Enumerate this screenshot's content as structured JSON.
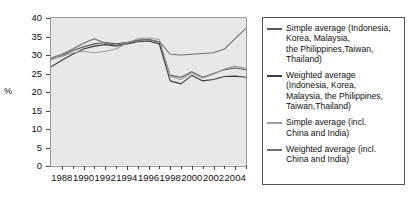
{
  "chart_data": {
    "type": "line",
    "title": "",
    "xlabel": "",
    "ylabel": "%",
    "ylim": [
      0,
      40
    ],
    "xlim": [
      1987,
      2005
    ],
    "ytick_labels": [
      "40",
      "35",
      "30",
      "25",
      "20",
      "15",
      "10",
      "5",
      "0"
    ],
    "ytick_values": [
      40,
      35,
      30,
      25,
      20,
      15,
      10,
      5,
      0
    ],
    "xtick_labels": [
      "1988",
      "1990",
      "1992",
      "1994",
      "1996",
      "1998",
      "2000",
      "2002",
      "2004"
    ],
    "xtick_values": [
      1988,
      1990,
      1992,
      1994,
      1996,
      1998,
      2000,
      2002,
      2004
    ],
    "grid": false,
    "legend_position": "right-outside",
    "plot_background": "#e8e8e8",
    "x": [
      1987,
      1988,
      1989,
      1990,
      1991,
      1992,
      1993,
      1994,
      1995,
      1996,
      1997,
      1998,
      1999,
      2000,
      2001,
      2002,
      2003,
      2004,
      2005
    ],
    "series": [
      {
        "name": "Simple average (Indonesia, Korea, Malaysia, the Philippines, Taiwan, Thailand)",
        "color": "#5a5a5a",
        "values": [
          28.8,
          29.8,
          31.2,
          32.2,
          33.0,
          33.4,
          33.0,
          33.4,
          34.0,
          34.2,
          33.5,
          24.5,
          24.0,
          25.5,
          24.0,
          25.0,
          26.0,
          26.5,
          26.0
        ]
      },
      {
        "name": "Weighted average (Indonesia, Korea, Malaysia, the Philippines, Taiwan, Thailand)",
        "color": "#3c3c3c",
        "values": [
          26.8,
          28.6,
          30.2,
          31.6,
          32.4,
          32.8,
          32.4,
          33.0,
          33.6,
          33.8,
          33.0,
          23.0,
          22.2,
          24.5,
          23.0,
          23.4,
          24.2,
          24.3,
          24.0
        ]
      },
      {
        "name": "Simple average (incl. China and India)",
        "color": "#9e9e9e",
        "values": [
          29.0,
          29.6,
          30.6,
          31.0,
          30.6,
          31.0,
          31.6,
          33.2,
          34.4,
          34.6,
          34.2,
          24.2,
          23.4,
          25.2,
          23.8,
          24.8,
          26.2,
          27.0,
          26.4
        ]
      },
      {
        "name": "Weighted average (incl. China and India)",
        "color": "#6e6e6e",
        "values": [
          29.2,
          30.2,
          31.6,
          33.2,
          34.4,
          33.2,
          32.6,
          33.2,
          34.0,
          34.2,
          33.6,
          30.2,
          30.0,
          30.2,
          30.4,
          30.6,
          31.6,
          34.4,
          37.2
        ]
      }
    ]
  },
  "axis": {
    "y_unit_label": "%"
  },
  "legend": {
    "entries": [
      {
        "label": "Simple average (Indonesia,\nKorea, Malaysia,\nthe Philippines,Taiwan,\nThailand)",
        "color": "#5a5a5a"
      },
      {
        "label": "Weighted average\n(Indonesia, Korea,\nMalaysia, the Philippines,\nTaiwan,Thailand)",
        "color": "#3c3c3c"
      },
      {
        "label": "Simple average (incl.\nChina and India)",
        "color": "#9e9e9e"
      },
      {
        "label": "Weighted average (incl.\nChina and India)",
        "color": "#6e6e6e"
      }
    ]
  }
}
